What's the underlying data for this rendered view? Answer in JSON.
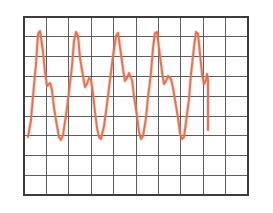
{
  "figure": {
    "background_color": "#ffffff",
    "width": 273,
    "height": 213
  },
  "grid": {
    "name": "graph-paper-grid",
    "line_color": "#4a4a4a",
    "border_color": "#3c3c3c",
    "x_left": 24,
    "x_right": 248,
    "y_top": 17,
    "y_bottom": 195,
    "columns": 10,
    "rows": 9,
    "cell_width": 22.4,
    "cell_height": 19.8,
    "x_lines": [
      24,
      46.4,
      68.8,
      91.2,
      113.6,
      136,
      158.4,
      180.8,
      203.2,
      225.6,
      248
    ],
    "y_lines": [
      17,
      36.8,
      56.6,
      76.4,
      96.2,
      116,
      135.8,
      155.6,
      175.4,
      195.2
    ]
  },
  "chart_data": {
    "type": "line",
    "subtitle": "",
    "xlabel": "",
    "ylabel": "",
    "xlim": [
      24,
      248
    ],
    "ylim": [
      17,
      195
    ],
    "grid": true,
    "legend_position": "none",
    "cycles": 5,
    "series": [
      {
        "name": "waveform",
        "color": "#e8694a",
        "line_width": 1.9,
        "description": "Repeating five-cycle pulse: sharp tall primary peak, drop to a mid-level shoulder notch, small secondary bump, then a deep trough down to the baseline.",
        "points": [
          [
            28,
            137
          ],
          [
            31,
            120
          ],
          [
            33,
            96
          ],
          [
            36,
            64
          ],
          [
            38,
            34
          ],
          [
            40,
            31
          ],
          [
            43,
            52
          ],
          [
            45,
            72
          ],
          [
            47,
            86
          ],
          [
            50,
            83
          ],
          [
            52,
            90
          ],
          [
            54,
            108
          ],
          [
            57,
            126
          ],
          [
            59,
            137
          ],
          [
            61,
            140
          ],
          [
            63,
            135
          ],
          [
            66,
            115
          ],
          [
            69,
            92
          ],
          [
            72,
            66
          ],
          [
            74,
            41
          ],
          [
            76,
            32
          ],
          [
            78,
            36
          ],
          [
            80,
            58
          ],
          [
            83,
            76
          ],
          [
            85,
            87
          ],
          [
            87,
            84
          ],
          [
            89,
            78
          ],
          [
            91,
            80
          ],
          [
            93,
            94
          ],
          [
            95,
            112
          ],
          [
            97,
            128
          ],
          [
            99,
            137
          ],
          [
            101,
            139
          ],
          [
            104,
            126
          ],
          [
            107,
            104
          ],
          [
            110,
            80
          ],
          [
            113,
            56
          ],
          [
            116,
            36
          ],
          [
            118,
            33
          ],
          [
            120,
            47
          ],
          [
            123,
            69
          ],
          [
            125,
            81
          ],
          [
            127,
            78
          ],
          [
            129,
            73
          ],
          [
            132,
            80
          ],
          [
            134,
            96
          ],
          [
            137,
            116
          ],
          [
            139,
            132
          ],
          [
            141,
            139
          ],
          [
            143,
            136
          ],
          [
            146,
            118
          ],
          [
            148,
            97
          ],
          [
            151,
            73
          ],
          [
            153,
            48
          ],
          [
            155,
            33
          ],
          [
            157,
            32
          ],
          [
            159,
            48
          ],
          [
            162,
            72
          ],
          [
            164,
            84
          ],
          [
            166,
            81
          ],
          [
            168,
            76
          ],
          [
            171,
            79
          ],
          [
            173,
            88
          ],
          [
            175,
            100
          ],
          [
            178,
            118
          ],
          [
            180,
            133
          ],
          [
            182,
            139
          ],
          [
            184,
            137
          ],
          [
            186,
            122
          ],
          [
            189,
            99
          ],
          [
            191,
            74
          ],
          [
            194,
            47
          ],
          [
            196,
            32
          ],
          [
            198,
            34
          ],
          [
            200,
            54
          ],
          [
            202,
            74
          ],
          [
            204,
            84
          ],
          [
            206,
            80
          ],
          [
            207,
            74
          ],
          [
            208,
            79
          ],
          [
            208,
            96
          ],
          [
            208,
            114
          ],
          [
            208,
            130
          ]
        ]
      }
    ]
  }
}
